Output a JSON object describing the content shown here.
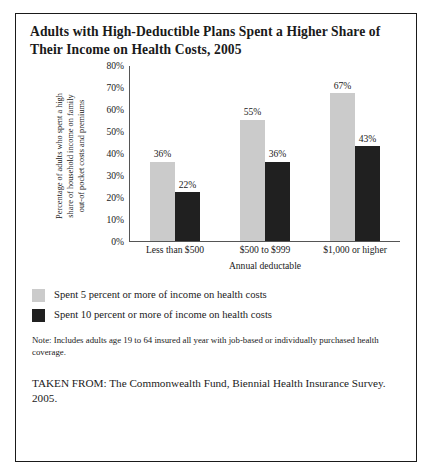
{
  "figure": {
    "title": "Adults with High-Deductible Plans Spent a Higher Share of Their Income on Health Costs, 2005",
    "note": "Note: Includes adults age 19 to 64 insured all year with job-based or individually purchased health coverage.",
    "source": "TAKEN FROM: The Commonwealth Fund, Biennial Health Insurance Survey. 2005."
  },
  "chart_data": {
    "type": "bar",
    "title": "Adults with High-Deductible Plans Spent a Higher Share of Their Income on Health Costs, 2005",
    "categories": [
      "Less than $500",
      "$500 to $999",
      "$1,000 or higher"
    ],
    "series": [
      {
        "name": "Spent 5 percent or more of income on health costs",
        "color": "#cbcbcb",
        "values": [
          36,
          55,
          67
        ],
        "labels": [
          "36%",
          "55%",
          "67%"
        ]
      },
      {
        "name": "Spent 10 percent or more of income on health costs",
        "color": "#202020",
        "values": [
          22,
          36,
          43
        ],
        "labels": [
          "22%",
          "36%",
          "43%"
        ]
      }
    ],
    "xlabel": "Annual deductable",
    "ylabel": "Percentage of adults who spent a high share of household income on family out-of pocket costs and premiums",
    "ylabel_lines": "Percentage of adults who spent a high\nshare of household income on family\nout-of pocket costs and premiums",
    "ylim": [
      0,
      80
    ],
    "ytick_values": [
      0,
      10,
      20,
      30,
      40,
      50,
      60,
      70,
      80
    ],
    "ytick_labels": [
      "0%",
      "10%",
      "20%",
      "30%",
      "40%",
      "50%",
      "60%",
      "70%",
      "80%"
    ],
    "grid": false,
    "legend_position": "below-plot-left",
    "value_labels": true
  }
}
